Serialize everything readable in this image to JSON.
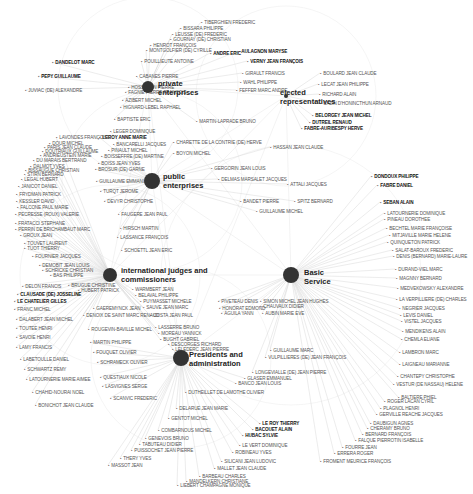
{
  "hubs": [
    {
      "id": "private",
      "label1": "private",
      "label2": "enterprises",
      "x": 148,
      "y": 87,
      "r": 6,
      "lx": 158,
      "ly": 79
    },
    {
      "id": "elected",
      "label1": "elected",
      "label2": "representatives",
      "x": 286,
      "y": 96,
      "r": 2,
      "lx": 280,
      "ly": 88
    },
    {
      "id": "public",
      "label1": "public",
      "label2": "enterprises",
      "x": 152,
      "y": 181,
      "r": 8,
      "lx": 163,
      "ly": 172
    },
    {
      "id": "intl",
      "label1": "international judges and",
      "label2": "commissioners",
      "x": 110,
      "y": 275,
      "r": 7,
      "lx": 121,
      "ly": 266
    },
    {
      "id": "basic",
      "label1": "Basic",
      "label2": "Service",
      "x": 291,
      "y": 275,
      "r": 8,
      "lx": 304,
      "ly": 268
    },
    {
      "id": "presidents",
      "label1": "Presidents and",
      "label2": "administration",
      "x": 181,
      "y": 358,
      "r": 8,
      "lx": 189,
      "ly": 350
    }
  ],
  "nodes": [
    {
      "t": "TIBERGHIEN FREDERIC",
      "x": 201,
      "y": 20,
      "hub": "private"
    },
    {
      "t": "BISSARA PHILIPPE",
      "x": 180,
      "y": 26,
      "hub": "private"
    },
    {
      "t": "LEUSSE (DE) FREDERIC",
      "x": 172,
      "y": 32,
      "hub": "private"
    },
    {
      "t": "GOURNAY (DE) CHRISTIAN",
      "x": 170,
      "y": 37,
      "hub": "private"
    },
    {
      "t": "HENROT FRANÇOIS",
      "x": 150,
      "y": 43,
      "hub": "private"
    },
    {
      "t": "MONTGOLFIER (DE) CYRILLE",
      "x": 146,
      "y": 48,
      "hub": "private"
    },
    {
      "t": "POUILLIEUTE ANTOINE",
      "x": 141,
      "y": 59,
      "hub": "private"
    },
    {
      "t": "ANDRE ERIC",
      "x": 210,
      "y": 51,
      "hub": "private",
      "bold": true
    },
    {
      "t": "AULAGNON MARYSE",
      "x": 238,
      "y": 49,
      "hub": "private",
      "bold": true
    },
    {
      "t": "VERNY JEAN FRANÇOIS",
      "x": 247,
      "y": 59,
      "hub": "private",
      "bold": true
    },
    {
      "t": "CABANES PIERRE",
      "x": 136,
      "y": 74,
      "hub": "private"
    },
    {
      "t": "HOSS JEAN PIERRE",
      "x": 128,
      "y": 85,
      "hub": "private"
    },
    {
      "t": "FAGNIE PIERRE FRANÇOIS",
      "x": 125,
      "y": 90,
      "hub": "private"
    },
    {
      "t": "AZIBERT MICHEL",
      "x": 122,
      "y": 98,
      "hub": "private"
    },
    {
      "t": "HIGNARD-LEBEL RAPHAEL",
      "x": 120,
      "y": 105,
      "hub": "private"
    },
    {
      "t": "BAPTISTE ERIC",
      "x": 114,
      "y": 117,
      "hub": "private"
    },
    {
      "t": "GIRAULT FRANCIS",
      "x": 242,
      "y": 71,
      "hub": "private"
    },
    {
      "t": "WAHL PHILIPPE",
      "x": 240,
      "y": 80,
      "hub": "private"
    },
    {
      "t": "FEFFER MARC ANDRE",
      "x": 236,
      "y": 88,
      "hub": "private"
    },
    {
      "t": "MARTIN-LAPRADE BRUNO",
      "x": 196,
      "y": 119,
      "hub": "private"
    },
    {
      "t": "BOULARD JEAN CLAUDE",
      "x": 320,
      "y": 71,
      "hub": "elected"
    },
    {
      "t": "LECAT JEAN PHILIPPE",
      "x": 318,
      "y": 82,
      "hub": "elected"
    },
    {
      "t": "RICHARD ALAIN",
      "x": 319,
      "y": 92,
      "hub": "elected"
    },
    {
      "t": "CAZIN D'HONINCTHUN ARNAUD",
      "x": 320,
      "y": 101,
      "hub": "elected"
    },
    {
      "t": "BELORGEY JEAN MICHEL",
      "x": 312,
      "y": 113,
      "hub": "elected",
      "bold": true
    },
    {
      "t": "DUTREIL RENAUD",
      "x": 309,
      "y": 120,
      "hub": "elected",
      "bold": true
    },
    {
      "t": "FABRE-AURIBESPY HERVE",
      "x": 301,
      "y": 126,
      "hub": "elected",
      "bold": true
    },
    {
      "t": "DANDELOT MARC",
      "x": 52,
      "y": 60,
      "hub": "private",
      "bold": true
    },
    {
      "t": "PEPY GUILLAUME",
      "x": 38,
      "y": 74,
      "hub": "private",
      "bold": true
    },
    {
      "t": "JUVIAC (DE) ALEXANDRE",
      "x": 25,
      "y": 88,
      "hub": "private"
    },
    {
      "t": "LEGER DOMINIQUE",
      "x": 110,
      "y": 129,
      "hub": "public"
    },
    {
      "t": "LEROY ANNE MARIE",
      "x": 99,
      "y": 135,
      "hub": "public",
      "bold": true
    },
    {
      "t": "BANCARELLI JACQUES",
      "x": 113,
      "y": 142,
      "hub": "public"
    },
    {
      "t": "PINAULT MICHEL",
      "x": 108,
      "y": 148,
      "hub": "public"
    },
    {
      "t": "BOISSEFFRE (DE) MARTINE",
      "x": 101,
      "y": 154,
      "hub": "public"
    },
    {
      "t": "BOISS JEAN YVES",
      "x": 98,
      "y": 161,
      "hub": "public"
    },
    {
      "t": "BROSUR (DE) GARNE",
      "x": 95,
      "y": 167,
      "hub": "public"
    },
    {
      "t": "GUILLAUME EMMANUEL",
      "x": 96,
      "y": 179,
      "hub": "public"
    },
    {
      "t": "TURQT JEROME",
      "x": 100,
      "y": 189,
      "hub": "public"
    },
    {
      "t": "DEVYR CHRISTOPHE",
      "x": 104,
      "y": 199,
      "hub": "public"
    },
    {
      "t": "FAUGERE JEAN PAUL",
      "x": 118,
      "y": 212,
      "hub": "public"
    },
    {
      "t": "HIRSCH MARTIN",
      "x": 120,
      "y": 226,
      "hub": "public"
    },
    {
      "t": "LASSANCE FRANÇOIS",
      "x": 117,
      "y": 235,
      "hub": "public"
    },
    {
      "t": "SCHOETTL JEAN ERIC",
      "x": 121,
      "y": 248,
      "hub": "public"
    },
    {
      "t": "CHARETTE DE LA CONTRIE (DE) HERVE",
      "x": 173,
      "y": 140,
      "hub": "public"
    },
    {
      "t": "BOYON MICHEL",
      "x": 173,
      "y": 151,
      "hub": "public"
    },
    {
      "t": "HASSAN JEAN CLAUDE",
      "x": 270,
      "y": 145,
      "hub": "public"
    },
    {
      "t": "GERGORIN JEAN LOUIS",
      "x": 211,
      "y": 166,
      "hub": "public"
    },
    {
      "t": "DELMAS MARSALET JACQUES",
      "x": 218,
      "y": 177,
      "hub": "public"
    },
    {
      "t": "ATTALI JACQUES",
      "x": 287,
      "y": 182,
      "hub": "public"
    },
    {
      "t": "BANDET PIERRE",
      "x": 240,
      "y": 199,
      "hub": "public"
    },
    {
      "t": "SPITZ BERNARD",
      "x": 294,
      "y": 199,
      "hub": "public"
    },
    {
      "t": "GUILLAUME MICHEL",
      "x": 256,
      "y": 209,
      "hub": "public"
    },
    {
      "t": "LAVONDES FRANÇOISE",
      "x": 56,
      "y": 135,
      "hub": "intl"
    },
    {
      "t": "DOUR MICHEL",
      "x": 49,
      "y": 141,
      "hub": "intl"
    },
    {
      "t": "PARIS JEAN CLAUDE",
      "x": 44,
      "y": 145,
      "hub": "intl"
    },
    {
      "t": "DOUTRIAUX GUILLAUME",
      "x": 42,
      "y": 149,
      "hub": "intl"
    },
    {
      "t": "ANDRIEUSTEIN MARIE",
      "x": 40,
      "y": 153,
      "hub": "intl"
    },
    {
      "t": "DU MARAIS BERTRAND",
      "x": 33,
      "y": 158,
      "hub": "intl"
    },
    {
      "t": "DALMOT YVES",
      "x": 30,
      "y": 164,
      "hub": "intl"
    },
    {
      "t": "BISSAUGUE CHRISTIAN",
      "x": 25,
      "y": 168,
      "hub": "intl"
    },
    {
      "t": "STIRN BERNARD",
      "x": 24,
      "y": 172,
      "hub": "intl"
    },
    {
      "t": "LEGAL HUBERT",
      "x": 21,
      "y": 177,
      "hub": "intl"
    },
    {
      "t": "JANICOT DANIEL",
      "x": 18,
      "y": 184,
      "hub": "intl"
    },
    {
      "t": "FRYDMAN PATRICK",
      "x": 16,
      "y": 192,
      "hub": "intl"
    },
    {
      "t": "KESSLER DAVID",
      "x": 16,
      "y": 199,
      "hub": "intl"
    },
    {
      "t": "FALCONE PAUL MARIE",
      "x": 17,
      "y": 205,
      "hub": "intl"
    },
    {
      "t": "PECRESSE (ROUX) VALERIE",
      "x": 15,
      "y": 212,
      "hub": "intl"
    },
    {
      "t": "FRATACCI STEPHANE",
      "x": 15,
      "y": 221,
      "hub": "intl"
    },
    {
      "t": "PERRIN DE BRICHAMBAUT MARC",
      "x": 15,
      "y": 227,
      "hub": "intl"
    },
    {
      "t": "GROUX JEAN",
      "x": 20,
      "y": 233,
      "hub": "intl"
    },
    {
      "t": "TOUVET LAURENT",
      "x": 24,
      "y": 241,
      "hub": "intl"
    },
    {
      "t": "TUOT THIERRY",
      "x": 24,
      "y": 246,
      "hub": "intl"
    },
    {
      "t": "FOURNIER JACQUES",
      "x": 32,
      "y": 254,
      "hub": "intl"
    },
    {
      "t": "DEMOBIT JEAN LOUIS",
      "x": 39,
      "y": 263,
      "hub": "intl"
    },
    {
      "t": "SCHRICKE CHRISTIAN",
      "x": 42,
      "y": 268,
      "hub": "intl"
    },
    {
      "t": "BAS PHILIPPE",
      "x": 50,
      "y": 273,
      "hub": "intl"
    },
    {
      "t": "DELON FRANCIS",
      "x": 22,
      "y": 284,
      "hub": "intl"
    },
    {
      "t": "BRUGUE CHRISTINE",
      "x": 68,
      "y": 283,
      "hub": "intl"
    },
    {
      "t": "HUBERT PATRICK",
      "x": 78,
      "y": 288,
      "hub": "intl"
    },
    {
      "t": "CLAUSADE (DE) JOSSELINE",
      "x": 17,
      "y": 292,
      "hub": "intl",
      "bold": true
    },
    {
      "t": "LE CHATELIER GILLES",
      "x": 14,
      "y": 299,
      "hub": "intl",
      "bold": true
    },
    {
      "t": "FRANC MICHEL",
      "x": 14,
      "y": 307,
      "hub": "intl"
    },
    {
      "t": "DALABERT JEAN MICHEL",
      "x": 16,
      "y": 317,
      "hub": "intl"
    },
    {
      "t": "TOUTEE HENRI",
      "x": 16,
      "y": 326,
      "hub": "intl"
    },
    {
      "t": "SAVOIE HENRI",
      "x": 16,
      "y": 335,
      "hub": "intl"
    },
    {
      "t": "LAMY FRANCIS",
      "x": 16,
      "y": 345,
      "hub": "intl"
    },
    {
      "t": "LABETOULLE DANIEL",
      "x": 20,
      "y": 357,
      "hub": "intl"
    },
    {
      "t": "SCHWARTZ REMY",
      "x": 24,
      "y": 367,
      "hub": "intl"
    },
    {
      "t": "LATOURNERIE MARIE AIMEE",
      "x": 26,
      "y": 377,
      "hub": "intl"
    },
    {
      "t": "CHAHID-NOURAI NOEL",
      "x": 32,
      "y": 390,
      "hub": "intl"
    },
    {
      "t": "BONICHOT JEAN CLAUDE",
      "x": 35,
      "y": 403,
      "hub": "intl"
    },
    {
      "t": "WARMBERT JEAN",
      "x": 132,
      "y": 287,
      "hub": "intl"
    },
    {
      "t": "BELAVAL PHILIPPE",
      "x": 135,
      "y": 293,
      "hub": "intl"
    },
    {
      "t": "PUYMASSET MICHELE",
      "x": 140,
      "y": 299,
      "hub": "intl"
    },
    {
      "t": "SAUVE JEAN MARC",
      "x": 143,
      "y": 305,
      "hub": "intl"
    },
    {
      "t": "GAEREMYNCK JEAN",
      "x": 93,
      "y": 306,
      "hub": "intl"
    },
    {
      "t": "DENOIX DE SAINT MARC RENAUD",
      "x": 83,
      "y": 313,
      "hub": "intl"
    },
    {
      "t": "COSTA JEAN PAUL",
      "x": 150,
      "y": 313,
      "hub": "intl"
    },
    {
      "t": "ROUGEVIN-BAVILLE MICHEL",
      "x": 88,
      "y": 327,
      "hub": "intl"
    },
    {
      "t": "LASSERRE BRUNO",
      "x": 155,
      "y": 325,
      "hub": "intl"
    },
    {
      "t": "MOREAU YANNICK",
      "x": 158,
      "y": 331,
      "hub": "intl"
    },
    {
      "t": "BUGHT GABRIEL",
      "x": 160,
      "y": 337,
      "hub": "intl"
    },
    {
      "t": "DESCORGES RICHARD",
      "x": 168,
      "y": 342,
      "hub": "presidents"
    },
    {
      "t": "LELEDERC JEAN PIERRE",
      "x": 172,
      "y": 347,
      "hub": "presidents"
    },
    {
      "t": "MARTIN PHILIPPE",
      "x": 90,
      "y": 340,
      "hub": "presidents"
    },
    {
      "t": "FOUQUET OLIVIER",
      "x": 93,
      "y": 350,
      "hub": "presidents"
    },
    {
      "t": "SCHRAMECK OLIVIER",
      "x": 97,
      "y": 360,
      "hub": "presidents"
    },
    {
      "t": "QUESTIAUX NICOLE",
      "x": 100,
      "y": 375,
      "hub": "presidents"
    },
    {
      "t": "LASVIGNES SERGE",
      "x": 102,
      "y": 384,
      "hub": "presidents"
    },
    {
      "t": "SCANVIC FREDERIC",
      "x": 110,
      "y": 396,
      "hub": "presidents"
    },
    {
      "t": "PIVETEAU DENIS",
      "x": 218,
      "y": 299,
      "hub": "basic"
    },
    {
      "t": "SIMON MICHEL JEAN HUGHES",
      "x": 260,
      "y": 299,
      "hub": "basic"
    },
    {
      "t": "CHAUVAUX DIDIER",
      "x": 260,
      "y": 304,
      "hub": "basic"
    },
    {
      "t": "HONORAT EDMOND",
      "x": 219,
      "y": 306,
      "hub": "basic"
    },
    {
      "t": "AGUILA YANN",
      "x": 221,
      "y": 311,
      "hub": "basic"
    },
    {
      "t": "AUBIN MARIE EVE",
      "x": 262,
      "y": 311,
      "hub": "basic"
    },
    {
      "t": "GUILLAUME MARC",
      "x": 270,
      "y": 348,
      "hub": "basic"
    },
    {
      "t": "VULPILLIERES (DE) JEAN FRANÇOIS",
      "x": 265,
      "y": 355,
      "hub": "basic"
    },
    {
      "t": "LONGEVIALLE (DE) JEAN PIERRE",
      "x": 252,
      "y": 370,
      "hub": "basic"
    },
    {
      "t": "GLASER EMMANUEL",
      "x": 244,
      "y": 376,
      "hub": "presidents"
    },
    {
      "t": "BANCO JEAN LOUIS",
      "x": 235,
      "y": 381,
      "hub": "presidents"
    },
    {
      "t": "DUTHEILLET DE LAMOTHE OLIVIER",
      "x": 185,
      "y": 390,
      "hub": "presidents"
    },
    {
      "t": "DELARUE JEAN MARIE",
      "x": 176,
      "y": 406,
      "hub": "presidents"
    },
    {
      "t": "GENTOT MICHEL",
      "x": 168,
      "y": 416,
      "hub": "presidents"
    },
    {
      "t": "COMBARNOUS MICHEL",
      "x": 158,
      "y": 428,
      "hub": "presidents"
    },
    {
      "t": "GENEVOIS BRUNO",
      "x": 145,
      "y": 436,
      "hub": "presidents"
    },
    {
      "t": "TABUTEAU DIDIER",
      "x": 139,
      "y": 442,
      "hub": "presidents"
    },
    {
      "t": "PUISSOCHET JEAN PIERRE",
      "x": 131,
      "y": 448,
      "hub": "presidents"
    },
    {
      "t": "THERY YVES",
      "x": 120,
      "y": 456,
      "hub": "presidents"
    },
    {
      "t": "MASSOT JEAN",
      "x": 108,
      "y": 463,
      "hub": "presidents"
    },
    {
      "t": "LE ROY THIERRY",
      "x": 259,
      "y": 421,
      "hub": "presidents",
      "bold": true
    },
    {
      "t": "BACOUET ALAIN",
      "x": 252,
      "y": 427,
      "hub": "presidents",
      "bold": true
    },
    {
      "t": "HUBAC SYLVIE",
      "x": 242,
      "y": 433,
      "hub": "presidents",
      "bold": true
    },
    {
      "t": "LE VERT DOMINIQUE",
      "x": 239,
      "y": 443,
      "hub": "presidents"
    },
    {
      "t": "ROBINEAU YVES",
      "x": 232,
      "y": 450,
      "hub": "presidents"
    },
    {
      "t": "SILICANI JEAN LUDOVIC",
      "x": 221,
      "y": 459,
      "hub": "presidents"
    },
    {
      "t": "MALLET JEAN CLAUDE",
      "x": 214,
      "y": 466,
      "hub": "presidents"
    },
    {
      "t": "BARBEAU CHARLES",
      "x": 199,
      "y": 474,
      "hub": "presidents"
    },
    {
      "t": "MANDELKERN CHRISTIANE",
      "x": 186,
      "y": 479,
      "hub": "presidents"
    },
    {
      "t": "LIEBERT CHAMPAGNE MONIQUE",
      "x": 177,
      "y": 483,
      "hub": "presidents"
    },
    {
      "t": "DONDOUX PHILIPPE",
      "x": 371,
      "y": 174,
      "hub": "basic",
      "bold": true
    },
    {
      "t": "FABRE DANIEL",
      "x": 377,
      "y": 183,
      "hub": "basic",
      "bold": true
    },
    {
      "t": "SEBAN ALAIN",
      "x": 380,
      "y": 200,
      "hub": "basic",
      "bold": true
    },
    {
      "t": "LATOURNERIE DOMINIQUE",
      "x": 384,
      "y": 211,
      "hub": "basic"
    },
    {
      "t": "PINEAU DOROTHEE",
      "x": 384,
      "y": 217,
      "hub": "basic"
    },
    {
      "t": "BECHTEL MARIE FRANÇOISE",
      "x": 386,
      "y": 226,
      "hub": "basic"
    },
    {
      "t": "MITJAVILLE MARIE HELENE",
      "x": 389,
      "y": 233,
      "hub": "basic"
    },
    {
      "t": "QUINQUETON PATRICK",
      "x": 387,
      "y": 240,
      "hub": "basic"
    },
    {
      "t": "SALAT-BAROUX FREDERIC",
      "x": 392,
      "y": 248,
      "hub": "basic"
    },
    {
      "t": "DENIS (BERNARD) MARIE-LAURE",
      "x": 393,
      "y": 254,
      "hub": "basic"
    },
    {
      "t": "DURAND-VIEL MARC",
      "x": 395,
      "y": 267,
      "hub": "basic"
    },
    {
      "t": "MAGNNY BERNARD",
      "x": 396,
      "y": 276,
      "hub": "basic"
    },
    {
      "t": "MEDVEKOWSKY ALEXANDRE",
      "x": 397,
      "y": 286,
      "hub": "basic"
    },
    {
      "t": "LA VERPILLIERE (DE) CHARLES",
      "x": 396,
      "y": 297,
      "hub": "basic"
    },
    {
      "t": "NEGRIER JACQUES",
      "x": 399,
      "y": 306,
      "hub": "basic"
    },
    {
      "t": "LEVIS DANIEL",
      "x": 400,
      "y": 313,
      "hub": "basic"
    },
    {
      "t": "VISTEL JACQUES",
      "x": 401,
      "y": 319,
      "hub": "basic"
    },
    {
      "t": "MENDIKENS ALAIN",
      "x": 402,
      "y": 329,
      "hub": "basic"
    },
    {
      "t": "CHEMLA ELIANE",
      "x": 401,
      "y": 337,
      "hub": "basic"
    },
    {
      "t": "LAMBRON MARC",
      "x": 399,
      "y": 350,
      "hub": "basic"
    },
    {
      "t": "LAIGNEAU MARIANNE",
      "x": 399,
      "y": 362,
      "hub": "basic"
    },
    {
      "t": "CHANTEPY CHRISTOPHE",
      "x": 397,
      "y": 374,
      "hub": "basic"
    },
    {
      "t": "VESTUR (DE NASSAU) HELENE",
      "x": 393,
      "y": 382,
      "hub": "basic"
    },
    {
      "t": "BALTIERE PHIEL",
      "x": 398,
      "y": 395,
      "hub": "basic"
    },
    {
      "t": "ROGER LACAN CYRIL",
      "x": 384,
      "y": 399,
      "hub": "basic"
    },
    {
      "t": "PLAGNOL HENRI",
      "x": 380,
      "y": 406,
      "hub": "basic"
    },
    {
      "t": "GERVILLE REACHE JACQUES",
      "x": 376,
      "y": 412,
      "hub": "basic"
    },
    {
      "t": "DAUBIGUN AGNES",
      "x": 370,
      "y": 421,
      "hub": "basic"
    },
    {
      "t": "CHERAMY BRUNO",
      "x": 367,
      "y": 426,
      "hub": "basic"
    },
    {
      "t": "BERNARD FRANÇOIS",
      "x": 362,
      "y": 432,
      "hub": "basic"
    },
    {
      "t": "FALQUE PIERROTIN ISABELLE",
      "x": 355,
      "y": 438,
      "hub": "basic"
    },
    {
      "t": "FOURRE JEAN",
      "x": 342,
      "y": 445,
      "hub": "basic"
    },
    {
      "t": "ERRERA ROGER",
      "x": 334,
      "y": 451,
      "hub": "basic"
    },
    {
      "t": "FROMENT MEURICE FRANÇOIS",
      "x": 320,
      "y": 459,
      "hub": "basic"
    }
  ],
  "colors": {
    "hub": "#333333",
    "edge": "#cfcfcf",
    "label": "#555555",
    "bold_label": "#111111"
  }
}
